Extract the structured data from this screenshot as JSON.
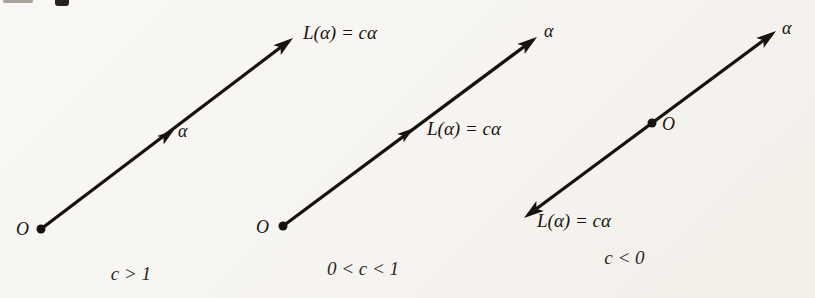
{
  "figure": {
    "colors": {
      "paper": "#f7f5f1",
      "ink": "#16130f"
    }
  },
  "diagrams": [
    {
      "caption": "c > 1",
      "origin_label": "O",
      "alpha_label": "α",
      "image_label": "L(α) = cα"
    },
    {
      "caption": "0 < c < 1",
      "origin_label": "O",
      "alpha_label": "α",
      "image_label": "L(α) = cα"
    },
    {
      "caption": "c < 0",
      "origin_label": "O",
      "alpha_label": "α",
      "image_label": "L(α) = cα"
    }
  ]
}
